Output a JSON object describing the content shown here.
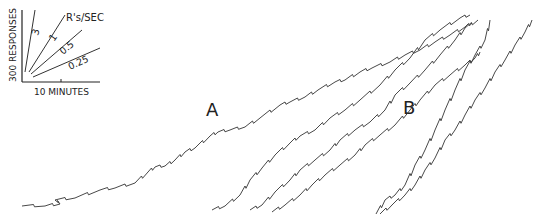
{
  "chart_data": {
    "type": "line",
    "title": "",
    "xlabel": "10 MINUTES",
    "ylabel": "300 RESPONSES",
    "panel_labels": [
      "A",
      "B"
    ],
    "grid": false,
    "legend": {
      "position": "top-left inset",
      "title": "R's/SEC",
      "rate_lines": [
        {
          "label": "3",
          "rate": 3
        },
        {
          "label": "1",
          "rate": 1
        },
        {
          "label": "0.5",
          "rate": 0.5
        },
        {
          "label": "0.25",
          "rate": 0.25
        }
      ]
    },
    "series": [
      {
        "name": "A-record-1",
        "points": [
          [
            22,
            206
          ],
          [
            45,
            206
          ],
          [
            60,
            204
          ],
          [
            55,
            200
          ],
          [
            75,
            198
          ],
          [
            100,
            190
          ],
          [
            115,
            188
          ],
          [
            135,
            183
          ],
          [
            148,
            172
          ],
          [
            155,
            167
          ],
          [
            165,
            166
          ],
          [
            175,
            160
          ],
          [
            185,
            152
          ],
          [
            195,
            148
          ],
          [
            210,
            136
          ],
          [
            218,
            132
          ],
          [
            230,
            130
          ],
          [
            245,
            127
          ],
          [
            260,
            118
          ],
          [
            280,
            105
          ],
          [
            290,
            102
          ],
          [
            305,
            97
          ],
          [
            318,
            90
          ],
          [
            335,
            82
          ],
          [
            345,
            80
          ],
          [
            360,
            72
          ],
          [
            372,
            68
          ],
          [
            390,
            62
          ],
          [
            405,
            55
          ],
          [
            420,
            50
          ],
          [
            435,
            42
          ],
          [
            450,
            35
          ],
          [
            465,
            27
          ],
          [
            472,
            23
          ]
        ]
      },
      {
        "name": "A-record-2",
        "points": [
          [
            212,
            210
          ],
          [
            225,
            206
          ],
          [
            240,
            195
          ],
          [
            250,
            180
          ],
          [
            262,
            168
          ],
          [
            275,
            155
          ],
          [
            290,
            143
          ],
          [
            300,
            136
          ],
          [
            315,
            130
          ],
          [
            330,
            118
          ],
          [
            345,
            110
          ],
          [
            360,
            100
          ],
          [
            380,
            85
          ],
          [
            395,
            70
          ],
          [
            410,
            58
          ],
          [
            425,
            40
          ],
          [
            440,
            30
          ],
          [
            460,
            18
          ],
          [
            470,
            15
          ]
        ]
      },
      {
        "name": "A-record-3",
        "points": [
          [
            250,
            210
          ],
          [
            262,
            205
          ],
          [
            275,
            192
          ],
          [
            290,
            180
          ],
          [
            300,
            170
          ],
          [
            315,
            160
          ],
          [
            330,
            150
          ],
          [
            340,
            140
          ],
          [
            355,
            130
          ],
          [
            370,
            122
          ],
          [
            385,
            110
          ],
          [
            395,
            95
          ],
          [
            410,
            83
          ],
          [
            425,
            70
          ],
          [
            440,
            55
          ],
          [
            455,
            40
          ],
          [
            465,
            28
          ],
          [
            478,
            20
          ]
        ]
      },
      {
        "name": "A-record-4",
        "points": [
          [
            272,
            212
          ],
          [
            285,
            205
          ],
          [
            300,
            195
          ],
          [
            312,
            185
          ],
          [
            325,
            175
          ],
          [
            340,
            165
          ],
          [
            355,
            155
          ],
          [
            365,
            145
          ],
          [
            380,
            135
          ],
          [
            395,
            125
          ],
          [
            410,
            110
          ],
          [
            420,
            100
          ],
          [
            435,
            85
          ],
          [
            450,
            75
          ],
          [
            465,
            65
          ],
          [
            475,
            58
          ],
          [
            480,
            52
          ]
        ]
      },
      {
        "name": "B-record-1",
        "points": [
          [
            376,
            214
          ],
          [
            385,
            200
          ],
          [
            395,
            195
          ],
          [
            405,
            185
          ],
          [
            415,
            165
          ],
          [
            425,
            150
          ],
          [
            435,
            130
          ],
          [
            445,
            110
          ],
          [
            455,
            90
          ],
          [
            465,
            70
          ],
          [
            475,
            55
          ],
          [
            485,
            40
          ],
          [
            490,
            20
          ]
        ]
      },
      {
        "name": "B-record-2",
        "points": [
          [
            380,
            214
          ],
          [
            392,
            205
          ],
          [
            405,
            195
          ],
          [
            415,
            185
          ],
          [
            425,
            170
          ],
          [
            435,
            158
          ],
          [
            445,
            140
          ],
          [
            455,
            130
          ],
          [
            465,
            115
          ],
          [
            475,
            100
          ],
          [
            485,
            88
          ],
          [
            495,
            72
          ],
          [
            505,
            60
          ],
          [
            515,
            45
          ],
          [
            525,
            32
          ],
          [
            532,
            20
          ]
        ]
      }
    ]
  },
  "labels": {
    "panel_a": "A",
    "panel_b": "B",
    "legend_title": "R's/SEC",
    "rate_3": "3",
    "rate_1": "1",
    "rate_05": "0.5",
    "rate_025": "0.25",
    "y_axis": "300 RESPONSES",
    "x_axis": "10 MINUTES"
  }
}
